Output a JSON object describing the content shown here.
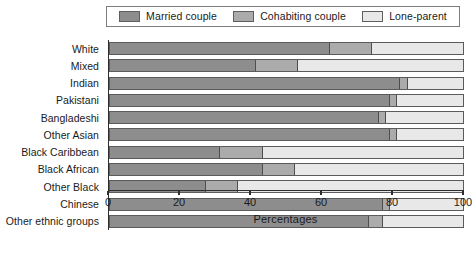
{
  "chart_data": {
    "type": "bar",
    "orientation": "horizontal",
    "stacked": true,
    "title": "",
    "xlabel": "Percentages",
    "ylabel": "",
    "xlim": [
      0,
      100
    ],
    "xticks": [
      0,
      20,
      40,
      60,
      80,
      100
    ],
    "xtick_labels": [
      "0",
      "20",
      "40",
      "60",
      "80",
      "100"
    ],
    "grid": false,
    "legend_position": "top",
    "categories": [
      "White",
      "Mixed",
      "Indian",
      "Pakistani",
      "Bangladeshi",
      "Other Asian",
      "Black Caribbean",
      "Black African",
      "Other Black",
      "Chinese",
      "Other ethnic groups"
    ],
    "series": [
      {
        "name": "Married couple",
        "color": "#8d8d8d",
        "values": [
          62,
          41,
          82,
          79,
          76,
          79,
          31,
          43,
          27,
          77,
          73
        ]
      },
      {
        "name": "Cohabiting couple",
        "color": "#ababab",
        "values": [
          12,
          12,
          2,
          2,
          2,
          2,
          12,
          9,
          9,
          2,
          4
        ]
      },
      {
        "name": "Lone-parent",
        "color": "#e8e8e8",
        "values": [
          26,
          47,
          16,
          19,
          22,
          19,
          57,
          48,
          64,
          21,
          23
        ]
      }
    ]
  },
  "legend": {
    "items": [
      {
        "label": "Married couple",
        "swatch": "#8d8d8d"
      },
      {
        "label": "Cohabiting couple",
        "swatch": "#ababab"
      },
      {
        "label": "Lone-parent",
        "swatch": "#e8e8e8"
      }
    ]
  },
  "axis": {
    "x_title": "Percentages"
  }
}
